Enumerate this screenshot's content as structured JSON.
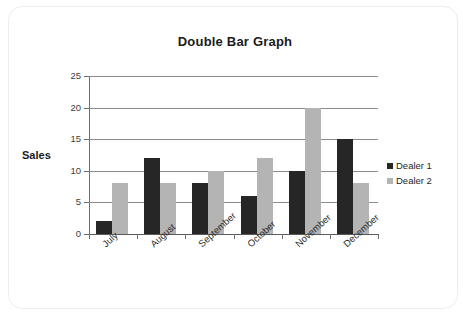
{
  "card": {
    "name": "chart-card"
  },
  "chart_data": {
    "type": "bar",
    "title": "Double Bar Graph",
    "xlabel": "",
    "ylabel": "Sales",
    "ylim": [
      0,
      25
    ],
    "ytick_labels": [
      "0",
      "5",
      "10",
      "15",
      "20",
      "25"
    ],
    "ytick_values": [
      0,
      5,
      10,
      15,
      20,
      25
    ],
    "grid": true,
    "legend_position": "right",
    "categories": [
      "July",
      "August",
      "September",
      "October",
      "November",
      "December"
    ],
    "series": [
      {
        "name": "Dealer 1",
        "color": "#262626",
        "values": [
          2,
          12,
          8,
          6,
          10,
          15
        ]
      },
      {
        "name": "Dealer 2",
        "color": "#b4b4b4",
        "values": [
          8,
          8,
          10,
          12,
          20,
          8
        ]
      }
    ]
  },
  "legend": {
    "items": [
      {
        "label": "Dealer 1",
        "swatch": "dark-square"
      },
      {
        "label": "Dealer 2",
        "swatch": "light-square"
      }
    ]
  }
}
